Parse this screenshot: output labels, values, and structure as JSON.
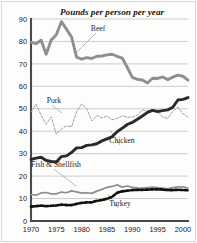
{
  "chart_data": {
    "type": "line",
    "title": "Pounds per person per year",
    "xlabel": "",
    "ylabel": "",
    "xlim": [
      1970,
      2001
    ],
    "ylim": [
      0,
      90
    ],
    "xticks": [
      "1970",
      "1975",
      "1980",
      "1985",
      "1990",
      "1995",
      "2000"
    ],
    "yticks": [
      "0",
      "10",
      "20",
      "30",
      "40",
      "50",
      "60",
      "70",
      "80",
      "90"
    ],
    "grid": true,
    "legend_position": "inline-labels",
    "x": [
      1970,
      1971,
      1972,
      1973,
      1974,
      1975,
      1976,
      1977,
      1978,
      1979,
      1980,
      1981,
      1982,
      1983,
      1984,
      1985,
      1986,
      1987,
      1988,
      1989,
      1990,
      1991,
      1992,
      1993,
      1994,
      1995,
      1996,
      1997,
      1998,
      1999,
      2000,
      2001
    ],
    "series": [
      {
        "name": "Beef",
        "color": "#8f8f8f",
        "style": "thick-solid",
        "values": [
          79.6,
          79.0,
          80.5,
          74.3,
          80.6,
          83.0,
          88.8,
          85.5,
          82.0,
          73.0,
          72.1,
          72.8,
          72.4,
          73.4,
          73.5,
          74.0,
          74.3,
          73.4,
          72.6,
          68.5,
          64.0,
          63.1,
          62.8,
          61.5,
          63.6,
          63.5,
          64.2,
          63.0,
          64.1,
          65.0,
          64.5,
          62.8
        ]
      },
      {
        "name": "Pork",
        "color": "#9a9a9a",
        "style": "thin-dashed",
        "values": [
          48.6,
          51.9,
          47.1,
          43.1,
          46.4,
          38.7,
          41.0,
          42.4,
          42.0,
          48.6,
          52.1,
          50.1,
          44.6,
          47.1,
          45.9,
          46.8,
          45.1,
          45.7,
          46.9,
          46.2,
          46.3,
          47.2,
          49.5,
          48.9,
          49.5,
          48.9,
          46.3,
          45.7,
          48.9,
          50.7,
          47.8,
          46.3
        ]
      },
      {
        "name": "Chicken",
        "color": "#2a2a2a",
        "style": "thick-solid",
        "values": [
          27.4,
          28.0,
          28.4,
          27.0,
          26.5,
          26.3,
          28.7,
          29.0,
          30.5,
          32.6,
          32.7,
          33.7,
          33.9,
          34.4,
          35.7,
          36.6,
          37.5,
          39.8,
          41.3,
          43.0,
          43.9,
          45.3,
          46.8,
          48.4,
          49.3,
          48.8,
          49.2,
          49.5,
          50.7,
          53.9,
          54.2,
          55.0
        ]
      },
      {
        "name": "Fish & Shellfish",
        "color": "#8f8f8f",
        "style": "medium-solid",
        "values": [
          11.8,
          11.5,
          12.5,
          12.7,
          12.1,
          12.1,
          12.9,
          12.6,
          13.4,
          13.0,
          12.4,
          12.6,
          12.3,
          13.3,
          14.1,
          15.0,
          15.4,
          16.1,
          15.1,
          15.6,
          15.0,
          14.8,
          14.7,
          14.9,
          15.1,
          14.9,
          14.7,
          14.3,
          14.9,
          15.2,
          15.2,
          14.7
        ]
      },
      {
        "name": "Turkey",
        "color": "#111111",
        "style": "heavy-dashed",
        "values": [
          6.4,
          6.6,
          6.9,
          6.6,
          6.8,
          6.9,
          7.3,
          7.1,
          7.1,
          7.6,
          8.1,
          8.3,
          8.3,
          9.0,
          9.3,
          9.9,
          10.7,
          12.6,
          13.2,
          13.5,
          13.8,
          13.9,
          13.9,
          14.0,
          14.1,
          14.1,
          14.0,
          13.8,
          13.8,
          13.9,
          13.8,
          13.7
        ]
      }
    ],
    "annotations": [
      {
        "name": "Beef",
        "x_px": 98,
        "y_px": 31
      },
      {
        "name": "Pork",
        "x_px": 54,
        "y_px": 103
      },
      {
        "name": "Chicken",
        "x_px": 122,
        "y_px": 143
      },
      {
        "name": "Fish & Shellfish",
        "x_px": 56,
        "y_px": 167
      },
      {
        "name": "Turkey",
        "x_px": 120,
        "y_px": 206
      }
    ]
  },
  "axis": {
    "y_labels": [
      "90",
      "80",
      "70",
      "60",
      "50",
      "40",
      "30",
      "20",
      "10",
      "0"
    ],
    "x_labels": [
      "1970",
      "1975",
      "1980",
      "1985",
      "1990",
      "1995",
      "2000"
    ]
  }
}
